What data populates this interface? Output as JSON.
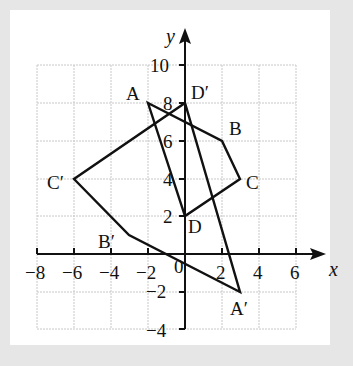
{
  "figure": {
    "type": "coordinate-plane-transformation",
    "axes": {
      "x_label": "x",
      "y_label": "y",
      "x_range": [
        -8,
        6
      ],
      "y_range": [
        -4,
        10
      ],
      "x_ticks": [
        "−8",
        "−6",
        "−4",
        "−2",
        "0",
        "2",
        "4",
        "6"
      ],
      "y_ticks": [
        "10",
        "8",
        "6",
        "4",
        "2",
        "−2",
        "−4"
      ],
      "origin_label": "0",
      "grid_step": 2
    },
    "shapes": [
      {
        "name": "ABCD",
        "points": {
          "A": [
            -2,
            8
          ],
          "B": [
            2,
            6
          ],
          "C": [
            3,
            4
          ],
          "D": [
            0,
            2
          ]
        }
      },
      {
        "name": "A'B'C'D'",
        "points": {
          "A'": [
            3,
            -2
          ],
          "B'": [
            -3,
            1
          ],
          "C'": [
            -6,
            4
          ],
          "D'": [
            0,
            8
          ]
        }
      }
    ],
    "labels": {
      "A": "A",
      "B": "B",
      "C": "C",
      "D": "D",
      "A_prime": "A′",
      "B_prime": "B′",
      "C_prime": "C′",
      "D_prime": "D′"
    }
  }
}
